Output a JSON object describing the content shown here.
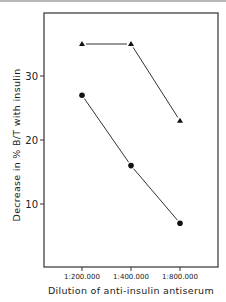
{
  "chart_data": {
    "type": "line",
    "title": "",
    "xlabel": "Dilution of anti-insulin antiserum",
    "ylabel": "Decrease in % B/T with insulin",
    "categories": [
      "1:200.000",
      "1:400.000",
      "1:800.000"
    ],
    "yticks": [
      10,
      20,
      30
    ],
    "ylim": [
      0,
      38
    ],
    "grid": false,
    "legend": "none",
    "series": [
      {
        "name": "triangles",
        "marker": "triangle",
        "values": [
          35,
          35,
          23
        ],
        "connect": [
          [
            1,
            2
          ]
        ],
        "connect_first": [
          [
            0,
            1
          ]
        ]
      },
      {
        "name": "circles",
        "marker": "circle",
        "values": [
          27,
          16,
          7
        ]
      }
    ]
  }
}
